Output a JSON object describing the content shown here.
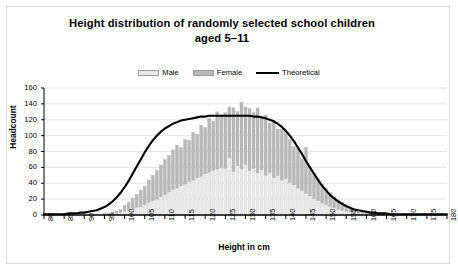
{
  "chart_data": {
    "type": "bar",
    "title": "Height distribution of randomly selected school children aged 5–11",
    "title_line1": "Height distribution of randomly selected school children",
    "title_line2": "aged 5–11",
    "xlabel": "Height in cm",
    "ylabel": "Headcount",
    "xlim": [
      80,
      180
    ],
    "ylim": [
      0,
      160
    ],
    "grid": true,
    "stacked": true,
    "legend_position": "top-center",
    "legend": [
      "Male",
      "Female",
      "Theoretical"
    ],
    "colors": {
      "male": "#e8e8e8",
      "female": "#b8b8b8",
      "theoretical": "#000000",
      "gridline": "#e4e4e4",
      "axis": "#000000",
      "frame": "#d8d8d8",
      "background": "#ffffff"
    },
    "xticks": [
      80,
      85,
      90,
      95,
      100,
      105,
      110,
      115,
      120,
      125,
      130,
      135,
      140,
      145,
      150,
      155,
      160,
      165,
      170,
      175,
      180
    ],
    "yticks": [
      0,
      20,
      40,
      60,
      80,
      100,
      120,
      140,
      160
    ],
    "x": [
      80,
      81,
      82,
      83,
      84,
      85,
      86,
      87,
      88,
      89,
      90,
      91,
      92,
      93,
      94,
      95,
      96,
      97,
      98,
      99,
      100,
      101,
      102,
      103,
      104,
      105,
      106,
      107,
      108,
      109,
      110,
      111,
      112,
      113,
      114,
      115,
      116,
      117,
      118,
      119,
      120,
      121,
      122,
      123,
      124,
      125,
      126,
      127,
      128,
      129,
      130,
      131,
      132,
      133,
      134,
      135,
      136,
      137,
      138,
      139,
      140,
      141,
      142,
      143,
      144,
      145,
      146,
      147,
      148,
      149,
      150,
      151,
      152,
      153,
      154,
      155,
      156,
      157,
      158,
      159,
      160,
      161,
      162,
      163,
      164,
      165,
      166,
      167,
      168,
      169,
      170
    ],
    "series": [
      {
        "name": "Male",
        "values": [
          0,
          0,
          0,
          0,
          0,
          0,
          0,
          0,
          0,
          0,
          0,
          0,
          0,
          0,
          0,
          1,
          1,
          2,
          2,
          3,
          5,
          6,
          8,
          10,
          11,
          13,
          16,
          18,
          20,
          23,
          26,
          29,
          32,
          34,
          37,
          39,
          42,
          44,
          47,
          49,
          52,
          54,
          56,
          58,
          60,
          59,
          72,
          55,
          62,
          58,
          64,
          56,
          59,
          53,
          57,
          50,
          54,
          47,
          50,
          44,
          46,
          41,
          38,
          34,
          31,
          27,
          24,
          21,
          18,
          15,
          13,
          11,
          9,
          7,
          6,
          5,
          4,
          3,
          2,
          2,
          1,
          1,
          1,
          0,
          0,
          0,
          0,
          0,
          0,
          0,
          0
        ]
      },
      {
        "name": "Female",
        "values": [
          0,
          0,
          0,
          0,
          0,
          0,
          0,
          0,
          0,
          0,
          0,
          0,
          0,
          0,
          0,
          1,
          1,
          2,
          3,
          4,
          7,
          10,
          13,
          16,
          20,
          23,
          28,
          32,
          36,
          40,
          44,
          46,
          50,
          54,
          48,
          56,
          52,
          60,
          55,
          64,
          58,
          68,
          62,
          72,
          66,
          70,
          64,
          80,
          68,
          84,
          72,
          78,
          70,
          82,
          66,
          76,
          62,
          72,
          58,
          64,
          60,
          54,
          48,
          50,
          40,
          58,
          36,
          32,
          28,
          24,
          20,
          17,
          14,
          12,
          10,
          8,
          7,
          5,
          4,
          3,
          2,
          2,
          1,
          1,
          1,
          0,
          0,
          0,
          0,
          0,
          0
        ]
      }
    ],
    "totals": [
      0,
      0,
      0,
      0,
      0,
      0,
      0,
      0,
      0,
      0,
      0,
      0,
      0,
      0,
      0,
      2,
      2,
      4,
      5,
      7,
      12,
      16,
      21,
      26,
      31,
      36,
      44,
      50,
      56,
      63,
      70,
      75,
      82,
      88,
      85,
      95,
      94,
      104,
      102,
      113,
      110,
      122,
      118,
      130,
      126,
      129,
      136,
      135,
      130,
      142,
      136,
      134,
      129,
      135,
      123,
      126,
      116,
      119,
      108,
      108,
      106,
      95,
      86,
      84,
      71,
      85,
      60,
      53,
      46,
      39,
      33,
      28,
      23,
      19,
      16,
      13,
      11,
      8,
      6,
      5,
      3,
      3,
      2,
      1,
      1,
      0,
      0,
      0,
      0,
      0,
      0
    ],
    "theoretical": {
      "name": "Theoretical",
      "mean": 128,
      "peak_value": 125,
      "values": [
        1,
        1,
        1,
        1,
        1,
        1,
        2,
        2,
        2,
        3,
        3,
        4,
        5,
        6,
        8,
        10,
        13,
        17,
        22,
        28,
        35,
        43,
        52,
        61,
        70,
        79,
        87,
        94,
        100,
        105,
        109,
        112,
        115,
        117,
        119,
        120,
        121,
        122,
        123,
        124,
        124,
        125,
        125,
        125,
        125,
        125,
        125,
        125,
        125,
        125,
        125,
        125,
        124,
        124,
        123,
        122,
        120,
        118,
        115,
        111,
        106,
        100,
        93,
        85,
        77,
        68,
        60,
        52,
        44,
        37,
        31,
        25,
        21,
        17,
        14,
        11,
        9,
        7,
        6,
        5,
        4,
        3,
        3,
        2,
        2,
        2,
        1,
        1,
        1,
        1,
        1
      ]
    }
  }
}
